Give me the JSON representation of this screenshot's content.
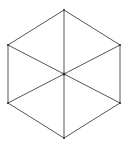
{
  "figure": {
    "name": "isometric-cube-hexagon",
    "canvas": {
      "width": 129,
      "height": 147,
      "background_color": "#ffffff"
    },
    "style": {
      "outline_color": "#555555",
      "outline_width": 1,
      "inner_diagonal_color": "#555555",
      "inner_diagonal_width": 1,
      "vertical_line_color": "#aaaaaa",
      "vertical_line_width": 2,
      "fill_color": "none",
      "vertex_dot_color": "#333333"
    },
    "hexagon": {
      "orientation": "pointy-top",
      "center": {
        "x": 64,
        "y": 74
      },
      "vertices": [
        {
          "id": "top",
          "label": "Top",
          "x": 64,
          "y": 10
        },
        {
          "id": "upper-right",
          "label": "Upper Right",
          "x": 120,
          "y": 45
        },
        {
          "id": "lower-right",
          "label": "Lower Right",
          "x": 120,
          "y": 103
        },
        {
          "id": "bottom",
          "label": "Bottom",
          "x": 64,
          "y": 138
        },
        {
          "id": "lower-left",
          "label": "Lower Left",
          "x": 8,
          "y": 103
        },
        {
          "id": "upper-left",
          "label": "Upper Left",
          "x": 8,
          "y": 45
        }
      ],
      "outline_path": "M 64 10 L 120 45 L 120 103 L 64 138 L 8 103 L 8 45 Z"
    },
    "inner_lines": [
      {
        "id": "vertical-axis",
        "label": "Vertical Axis",
        "from": {
          "x": 64,
          "y": 10
        },
        "to": {
          "x": 64,
          "y": 138
        },
        "color": "#aaaaaa",
        "width": 2
      },
      {
        "id": "diagonal-upper-left-to-lower-right",
        "label": "Diagonal Upper Left to Lower Right",
        "from": {
          "x": 8,
          "y": 45
        },
        "to": {
          "x": 120,
          "y": 103
        },
        "color": "#555555",
        "width": 1
      },
      {
        "id": "diagonal-upper-right-to-lower-left",
        "label": "Diagonal Upper Right to Lower Left",
        "from": {
          "x": 120,
          "y": 45
        },
        "to": {
          "x": 8,
          "y": 103
        },
        "color": "#555555",
        "width": 1
      }
    ],
    "center_marker": {
      "id": "center-point",
      "label": "Center",
      "x": 64,
      "y": 74,
      "radius": 1.6,
      "color": "#333333"
    }
  }
}
